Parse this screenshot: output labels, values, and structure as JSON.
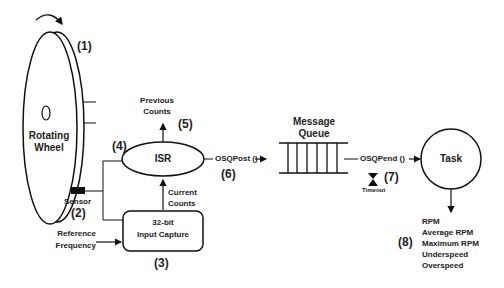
{
  "diagram": {
    "wheel": {
      "label_line1": "Rotating",
      "label_line2": "Wheel",
      "number": "(1)"
    },
    "sensor": {
      "label": "Sensor",
      "number": "(2)"
    },
    "input_capture": {
      "label_line1": "32-bit",
      "label_line2": "Input Capture",
      "number": "(3)"
    },
    "reference": {
      "label_line1": "Reference",
      "label_line2": "Frequency"
    },
    "isr": {
      "label": "ISR",
      "number": "(4)"
    },
    "previous_counts": {
      "label_line1": "Previous",
      "label_line2": "Counts",
      "number": "(5)"
    },
    "current_counts": {
      "label_line1": "Current",
      "label_line2": "Counts"
    },
    "post": {
      "label": "OSQPost ()",
      "number": "(6)"
    },
    "queue": {
      "label_line1": "Message",
      "label_line2": "Queue"
    },
    "pend": {
      "label": "OSQPend ()",
      "number": "(7)",
      "timeout": "Timeout"
    },
    "task": {
      "label": "Task"
    },
    "outputs": {
      "number": "(8)",
      "items": [
        "RPM",
        "Average RPM",
        "Maximum RPM",
        "Underspeed",
        "Overspeed"
      ]
    },
    "colors": {
      "line": "#111111",
      "text": "#222222",
      "background": "#ffffff"
    }
  }
}
